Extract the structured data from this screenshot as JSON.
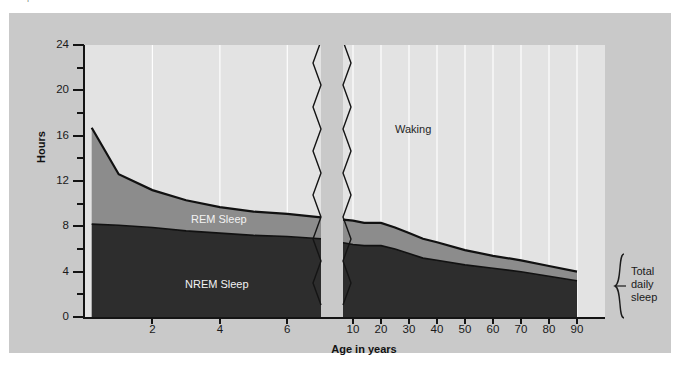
{
  "caption": {
    "text": "sleep in a lifetime of a human."
  },
  "chart_data": {
    "type": "area",
    "title": "",
    "subtitle": "",
    "xlabel": "Age in years",
    "ylabel": "Hours",
    "ylim": [
      0,
      24
    ],
    "yticks": [
      0,
      4,
      8,
      12,
      16,
      20,
      24
    ],
    "yminor": [
      2,
      6,
      10,
      14,
      18,
      22
    ],
    "xticks": [
      2,
      4,
      6,
      10,
      20,
      30,
      40,
      50,
      60,
      70,
      80,
      90
    ],
    "xtick_labels": [
      "2",
      "4",
      "6",
      "10",
      "20",
      "30",
      "40",
      "50",
      "60",
      "70",
      "80",
      "90"
    ],
    "axis_break": true,
    "axis_break_note": "x-axis broken between age 6-7 and age 10; left segment expanded scale, right segment compressed",
    "grid": "vertical-white",
    "legend_position": "in-plot",
    "stacked": true,
    "series": [
      {
        "name": "NREM Sleep",
        "color": "#2d2d2d",
        "x": [
          0.2,
          1,
          2,
          3,
          4,
          5,
          6,
          7,
          10,
          14,
          20,
          25,
          30,
          35,
          40,
          50,
          60,
          70,
          80,
          90
        ],
        "values": [
          8.2,
          8.1,
          7.9,
          7.6,
          7.4,
          7.2,
          7.1,
          6.9,
          6.4,
          6.3,
          6.3,
          6.0,
          5.6,
          5.2,
          5.0,
          4.6,
          4.3,
          4.0,
          3.6,
          3.2
        ]
      },
      {
        "name": "REM Sleep",
        "color": "#8c8c8c",
        "x": [
          0.2,
          1,
          2,
          3,
          4,
          5,
          6,
          7,
          10,
          14,
          20,
          25,
          30,
          35,
          40,
          50,
          60,
          70,
          80,
          90
        ],
        "values": [
          8.5,
          4.5,
          3.3,
          2.7,
          2.3,
          2.1,
          2.0,
          1.9,
          2.1,
          2.0,
          2.0,
          1.9,
          1.8,
          1.7,
          1.6,
          1.3,
          1.1,
          1.0,
          0.9,
          0.8
        ]
      },
      {
        "name": "Waking",
        "color": "#e3e3e3",
        "x": [
          0.2,
          90
        ],
        "values": [
          7.3,
          20.0
        ]
      }
    ],
    "total_daily_sleep": {
      "x": [
        0.2,
        1,
        2,
        3,
        4,
        5,
        6,
        7,
        10,
        14,
        20,
        25,
        30,
        35,
        40,
        50,
        60,
        70,
        80,
        90
      ],
      "values": [
        16.7,
        12.6,
        11.2,
        10.3,
        9.7,
        9.3,
        9.1,
        8.8,
        8.5,
        8.3,
        8.3,
        7.9,
        7.4,
        6.9,
        6.6,
        5.9,
        5.4,
        5.0,
        4.5,
        4.0
      ]
    },
    "annotations": [
      {
        "name": "waking-label",
        "text": "Waking",
        "x_px": 386,
        "y_px": 117
      },
      {
        "name": "rem-label",
        "text": "REM Sleep",
        "x_px": 182,
        "y_px": 206
      },
      {
        "name": "nrem-label",
        "text": "NREM Sleep",
        "x_px": 176,
        "y_px": 272
      },
      {
        "name": "total-daily-sleep-bracket",
        "text": "Total\ndaily\nsleep",
        "x_px": 622,
        "y_px": 252
      }
    ]
  },
  "labels": {
    "waking": "Waking",
    "rem": "REM Sleep",
    "nrem": "NREM Sleep",
    "axis_x": "Age in years",
    "axis_y": "Hours",
    "bracket_line1": "Total",
    "bracket_line2": "daily",
    "bracket_line3": "sleep"
  },
  "colors": {
    "page_background": "#ffffff",
    "panel_background": "#c9c9c9",
    "plot_background": "#e3e3e3",
    "rem_band": "#8c8c8c",
    "nrem_band": "#2d2d2d",
    "axis": "#141414",
    "gridline": "#ffffff",
    "text": "#1a1a1a"
  }
}
